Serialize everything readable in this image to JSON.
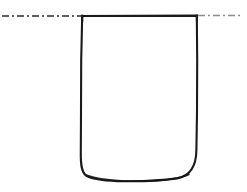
{
  "figure": {
    "kind": "line-drawing",
    "medium": "scanned ink drawing",
    "background_color": "#ffffff",
    "width": 247,
    "height": 192,
    "subject": "open-topped vessel outline crossed by a horizontal dash-dot reference line",
    "ink_color": "#1a1a1a",
    "reference_line_color_left": "#2b2b2b",
    "reference_line_color_right": "#8c8c8c"
  },
  "elements": {
    "reference_line": {
      "name": "horizontal dash-dot reference line",
      "style": "dash-dot",
      "y": 16,
      "x_start": 2,
      "x_end": 241,
      "stroke_width": 1.6,
      "dash_pattern": "7 3 2 3",
      "left_segment_x_end": 82,
      "right_segment_x_start": 197,
      "passes_behind_vessel": false
    },
    "vessel": {
      "name": "vessel outline",
      "top_left_x": 82,
      "top_right_x": 197,
      "top_y": 16,
      "bottom_y": 180,
      "left_wall_x": 81,
      "right_wall_x": 197,
      "corner_style_top": "square",
      "corner_style_bottom": "rounded",
      "bottom_corner_radius": 22,
      "bottom_edge_sag": 3,
      "stroke_width": 2.1,
      "fill": "none",
      "open_at_top": true
    }
  },
  "chart_data": {
    "type": "line",
    "title": "",
    "xlabel": "",
    "ylabel": "",
    "grid": false,
    "legend": "none",
    "xlim": [
      0,
      247
    ],
    "ylim": [
      192,
      0
    ],
    "series": [
      {
        "name": "reference-line-left",
        "style": "dash-dot",
        "x": [
          2,
          82
        ],
        "y": [
          16,
          16
        ]
      },
      {
        "name": "reference-line-right",
        "style": "dash-dot",
        "x": [
          197,
          241
        ],
        "y": [
          16,
          16
        ]
      },
      {
        "name": "vessel-top-edge",
        "style": "solid",
        "x": [
          82,
          197
        ],
        "y": [
          16,
          16
        ]
      },
      {
        "name": "vessel-left-wall",
        "style": "solid",
        "x": [
          82,
          81,
          81
        ],
        "y": [
          16,
          90,
          158
        ]
      },
      {
        "name": "vessel-right-wall",
        "style": "solid",
        "x": [
          197,
          197,
          196
        ],
        "y": [
          16,
          90,
          158
        ]
      },
      {
        "name": "vessel-bottom",
        "style": "solid",
        "x": [
          81,
          84,
          95,
          120,
          140,
          165,
          186,
          196
        ],
        "y": [
          158,
          171,
          178,
          180,
          180,
          179,
          172,
          158
        ]
      }
    ]
  }
}
